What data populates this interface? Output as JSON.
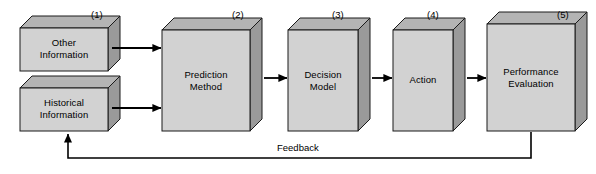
{
  "diagram": {
    "background_color": "#ffffff",
    "colors": {
      "box_front": "#d2d2d2",
      "box_top": "#b4b4b4",
      "box_side": "#9a9a9a",
      "outline": "#1a1a1a",
      "arrow": "#000000",
      "text": "#000000"
    },
    "boxes": [
      {
        "id": "other-information",
        "number": "(1)",
        "label": "Other\nInformation",
        "x": 20,
        "y": 28,
        "w": 88,
        "h": 43,
        "depth": 12,
        "num_x": 91,
        "num_y": 9
      },
      {
        "id": "historical-information",
        "number": "",
        "label": "Historical\nInformation",
        "x": 20,
        "y": 88,
        "w": 88,
        "h": 43,
        "depth": 12,
        "num_x": 0,
        "num_y": 0
      },
      {
        "id": "prediction-method",
        "number": "(2)",
        "label": "Prediction\nMethod",
        "x": 162,
        "y": 30,
        "w": 88,
        "h": 101,
        "depth": 12,
        "num_x": 232,
        "num_y": 9
      },
      {
        "id": "decision-model",
        "number": "(3)",
        "label": "Decision\nModel",
        "x": 288,
        "y": 30,
        "w": 70,
        "h": 101,
        "depth": 12,
        "num_x": 332,
        "num_y": 9
      },
      {
        "id": "action",
        "number": "(4)",
        "label": "Action",
        "x": 393,
        "y": 30,
        "w": 60,
        "h": 101,
        "depth": 12,
        "num_x": 427,
        "num_y": 9
      },
      {
        "id": "performance-evaluation",
        "number": "(5)",
        "label": "Performance\nEvaluation",
        "x": 487,
        "y": 24,
        "w": 88,
        "h": 107,
        "depth": 12,
        "num_x": 557,
        "num_y": 9
      }
    ],
    "connections": [
      {
        "id": "other-to-prediction",
        "from": "other-information",
        "to": "prediction-method",
        "label": ""
      },
      {
        "id": "historical-to-prediction",
        "from": "historical-information",
        "to": "prediction-method",
        "label": ""
      },
      {
        "id": "prediction-to-decision",
        "from": "prediction-method",
        "to": "decision-model",
        "label": ""
      },
      {
        "id": "decision-to-action",
        "from": "decision-model",
        "to": "action",
        "label": ""
      },
      {
        "id": "action-to-performance",
        "from": "action",
        "to": "performance-evaluation",
        "label": ""
      },
      {
        "id": "feedback-loop",
        "from": "performance-evaluation",
        "to": "historical-information",
        "label": "Feedback",
        "label_x": 277,
        "label_y": 142
      }
    ]
  }
}
